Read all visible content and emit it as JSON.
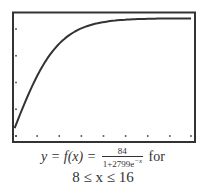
{
  "chart_data": {
    "type": "line",
    "title": "",
    "xlabel": "",
    "ylabel": "",
    "xlim": [
      8,
      16
    ],
    "ylim": [
      36.7,
      86.7
    ],
    "grid": false,
    "legend": null,
    "x_tick_dots": [
      8,
      9,
      10,
      11,
      12,
      13,
      14,
      15,
      16
    ],
    "y_tick_dots": [
      40,
      50,
      60,
      70,
      80
    ],
    "function": "y = 84 / (1 + 2799 e^{-x})",
    "series": [
      {
        "name": "f(x)",
        "x": [
          8,
          8.5,
          9,
          9.5,
          10,
          10.5,
          11,
          11.5,
          12,
          12.5,
          13,
          13.5,
          14,
          14.5,
          15,
          15.5,
          16
        ],
        "values": [
          43.3,
          52.8,
          61.0,
          67.8,
          72.9,
          76.6,
          79.1,
          80.7,
          81.8,
          82.5,
          83.0,
          83.3,
          83.5,
          83.6,
          83.7,
          83.8,
          83.9
        ]
      }
    ],
    "colors": {
      "curve": "#333333",
      "frame": "#333333",
      "dots": "#444444"
    }
  },
  "caption": {
    "lhs": "y = f(x) =",
    "numerator": "84",
    "denominator_base": "1+2799e",
    "denominator_exp": "−x",
    "for_label": "for",
    "domain": "8 ≤ x ≤ 16"
  }
}
